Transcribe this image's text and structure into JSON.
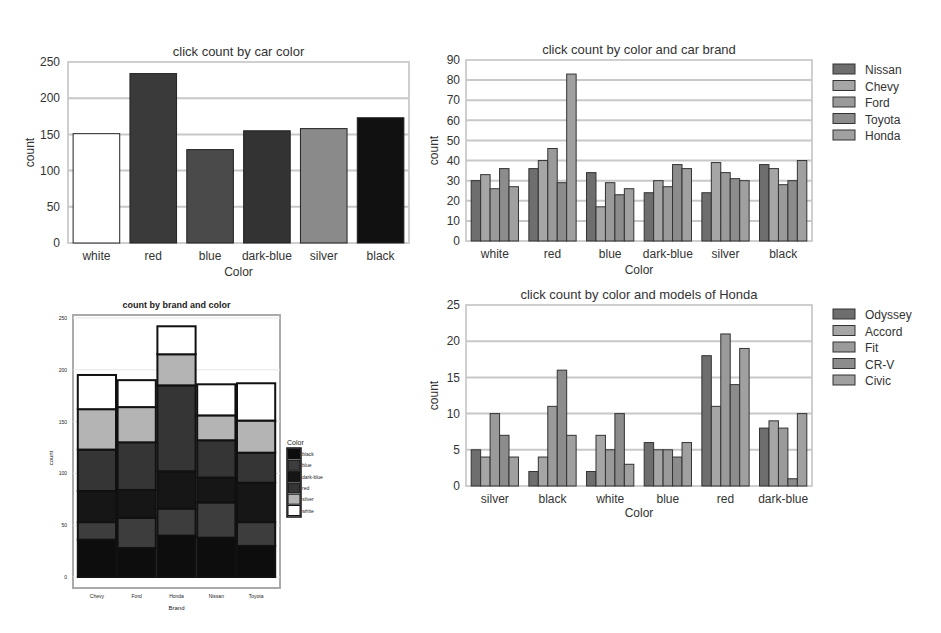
{
  "chart_data": [
    {
      "id": "color",
      "type": "bar",
      "title": "click count by car color",
      "xlabel": "Color",
      "ylabel": "count",
      "ylim": [
        0,
        250
      ],
      "yticks": [
        0,
        50,
        100,
        150,
        200,
        250
      ],
      "grid": true,
      "categories": [
        "white",
        "red",
        "blue",
        "dark-blue",
        "silver",
        "black"
      ],
      "values": [
        151,
        234,
        129,
        155,
        158,
        173
      ],
      "bar_colors": [
        "#ffffff",
        "#3a3a3a",
        "#4a4a4a",
        "#333333",
        "#8a8a8a",
        "#111111"
      ]
    },
    {
      "id": "brand",
      "type": "bar",
      "title": "click count by color and car brand",
      "xlabel": "Color",
      "ylabel": "count",
      "ylim": [
        0,
        90
      ],
      "yticks": [
        0,
        10,
        20,
        30,
        40,
        50,
        60,
        70,
        80,
        90
      ],
      "grid": true,
      "legend_position": "right",
      "categories": [
        "white",
        "red",
        "blue",
        "dark-blue",
        "silver",
        "black"
      ],
      "series": [
        {
          "name": "Nissan",
          "color": "#6e6e6e",
          "values": [
            30,
            36,
            34,
            24,
            24,
            38
          ]
        },
        {
          "name": "Chevy",
          "color": "#a6a6a6",
          "values": [
            33,
            40,
            17,
            30,
            39,
            36
          ]
        },
        {
          "name": "Ford",
          "color": "#9a9a9a",
          "values": [
            26,
            46,
            29,
            27,
            34,
            28
          ]
        },
        {
          "name": "Toyota",
          "color": "#8c8c8c",
          "values": [
            36,
            29,
            23,
            38,
            31,
            30
          ]
        },
        {
          "name": "Honda",
          "color": "#a0a0a0",
          "values": [
            27,
            83,
            26,
            36,
            30,
            40
          ]
        }
      ]
    },
    {
      "id": "stacked",
      "type": "bar",
      "stacked": true,
      "title": "count by brand and color",
      "xlabel": "Brand",
      "ylabel": "count",
      "ylim": [
        0,
        250
      ],
      "yticks": [
        0,
        50,
        100,
        150,
        200,
        250
      ],
      "grid": true,
      "legend_title": "Color",
      "legend_position": "right",
      "categories": [
        "Chevy",
        "Ford",
        "Honda",
        "Nissan",
        "Toyota"
      ],
      "series": [
        {
          "name": "black",
          "color": "#0d0d0d",
          "values": [
            36,
            28,
            40,
            38,
            30
          ]
        },
        {
          "name": "blue",
          "color": "#3d3d3d",
          "values": [
            17,
            29,
            26,
            34,
            23
          ]
        },
        {
          "name": "dark-blue",
          "color": "#161616",
          "values": [
            30,
            27,
            36,
            24,
            38
          ]
        },
        {
          "name": "red",
          "color": "#353535",
          "values": [
            40,
            46,
            83,
            36,
            29
          ]
        },
        {
          "name": "silver",
          "color": "#b4b4b4",
          "values": [
            39,
            34,
            30,
            24,
            31
          ]
        },
        {
          "name": "white",
          "color": "#ffffff",
          "values": [
            33,
            26,
            27,
            30,
            36
          ]
        }
      ]
    },
    {
      "id": "honda",
      "type": "bar",
      "title": "click count by color and models of Honda",
      "xlabel": "Color",
      "ylabel": "count",
      "ylim": [
        0,
        25
      ],
      "yticks": [
        0,
        5,
        10,
        15,
        20,
        25
      ],
      "grid": true,
      "legend_position": "right",
      "categories": [
        "silver",
        "black",
        "white",
        "blue",
        "red",
        "dark-blue"
      ],
      "series": [
        {
          "name": "Odyssey",
          "color": "#6e6e6e",
          "values": [
            5,
            2,
            2,
            6,
            18,
            8
          ]
        },
        {
          "name": "Accord",
          "color": "#a6a6a6",
          "values": [
            4,
            4,
            7,
            5,
            11,
            9
          ]
        },
        {
          "name": "Fit",
          "color": "#9a9a9a",
          "values": [
            10,
            11,
            5,
            5,
            21,
            8
          ]
        },
        {
          "name": "CR-V",
          "color": "#8c8c8c",
          "values": [
            7,
            16,
            10,
            4,
            14,
            1
          ]
        },
        {
          "name": "Civic",
          "color": "#a0a0a0",
          "values": [
            4,
            7,
            3,
            6,
            19,
            10
          ]
        }
      ]
    }
  ]
}
